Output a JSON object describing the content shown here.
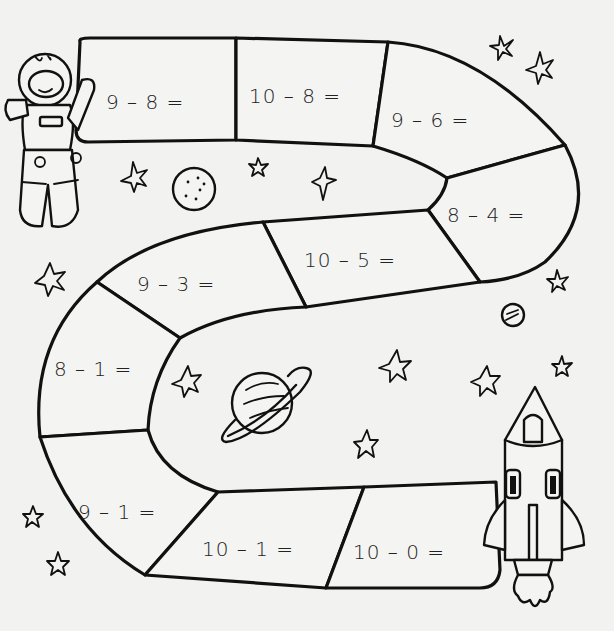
{
  "worksheet": {
    "theme": "space subtraction path",
    "path_squares": [
      {
        "id": 1,
        "equation": "9 – 8 ="
      },
      {
        "id": 2,
        "equation": "10 – 8 ="
      },
      {
        "id": 3,
        "equation": "9 – 6 ="
      },
      {
        "id": 4,
        "equation": "8 – 4 ="
      },
      {
        "id": 5,
        "equation": "10 – 5 ="
      },
      {
        "id": 6,
        "equation": "9 – 3 ="
      },
      {
        "id": 7,
        "equation": "8 – 1 ="
      },
      {
        "id": 8,
        "equation": "9 – 1 ="
      },
      {
        "id": 9,
        "equation": "10 – 1 ="
      },
      {
        "id": 10,
        "equation": "10 – 0 ="
      }
    ],
    "illustrations": [
      "astronaut",
      "moon",
      "ringed-planet",
      "small-planet",
      "rocket",
      "stars"
    ],
    "colors": {
      "ink": "#111111",
      "paper": "#f2f2f0"
    }
  }
}
